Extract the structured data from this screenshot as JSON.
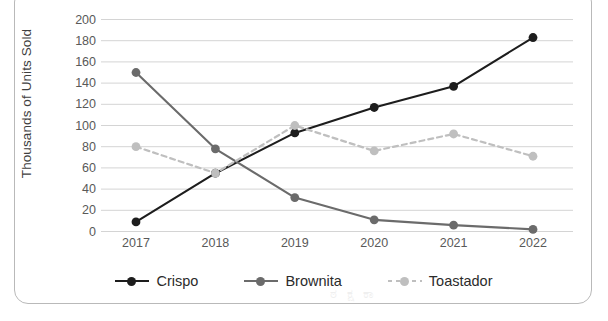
{
  "chart_data": {
    "type": "line",
    "title": "",
    "xlabel": "",
    "ylabel": "Thousands of Units Sold",
    "categories": [
      "2017",
      "2018",
      "2019",
      "2020",
      "2021",
      "2022"
    ],
    "ylim": [
      0,
      200
    ],
    "ytick_step": 20,
    "yticks": [
      200,
      180,
      160,
      140,
      120,
      100,
      80,
      60,
      40,
      20,
      0
    ],
    "grid": true,
    "legend_position": "bottom",
    "series": [
      {
        "name": "Crispo",
        "values": [
          9,
          55,
          93,
          117,
          137,
          183
        ],
        "color": "#1d1d1d",
        "marker": "circle",
        "linestyle": "solid"
      },
      {
        "name": "Brownita",
        "values": [
          150,
          78,
          32,
          11,
          6,
          2
        ],
        "color": "#6b6b6b",
        "marker": "circle",
        "linestyle": "solid"
      },
      {
        "name": "Toastador",
        "values": [
          80,
          55,
          100,
          76,
          92,
          71
        ],
        "color": "#bfbfbf",
        "marker": "circle",
        "linestyle": "dashed"
      }
    ]
  },
  "colors": {
    "frame_border": "#b9b9b9",
    "gridline": "#d4d4d4",
    "tick_text": "#595959",
    "axis_title": "#3f3f3f",
    "legend_text": "#2b2b2b",
    "background": "#ffffff"
  },
  "watermark": {
    "text": "ಠ ಕ್ಷ ಕಾ"
  }
}
